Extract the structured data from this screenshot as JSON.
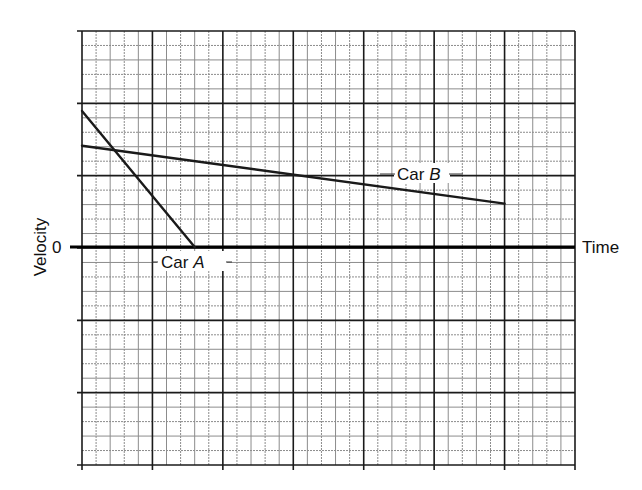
{
  "chart_data": {
    "type": "line",
    "title": "",
    "xlabel": "Time",
    "ylabel": "Velocity",
    "y_tick_labels": [
      {
        "value": 0,
        "label": "0"
      }
    ],
    "grid": {
      "on": true,
      "x_minor_units": 35,
      "y_minor_units": 30,
      "minor_per_major": 5,
      "x_range": [
        0,
        35
      ],
      "y_range": [
        -15,
        15
      ]
    },
    "xlim": [
      0,
      35
    ],
    "ylim": [
      -15,
      15
    ],
    "units": "grid squares (no numeric scale shown)",
    "legend": "none (inline labels)",
    "series": [
      {
        "name": "Car A",
        "label_text": "Car",
        "label_italic": "A",
        "points": [
          [
            0,
            9.4
          ],
          [
            8,
            0
          ]
        ],
        "color": "#1a1a1a"
      },
      {
        "name": "Car B",
        "label_text": "Car",
        "label_italic": "B",
        "points": [
          [
            0,
            7
          ],
          [
            30,
            3
          ]
        ],
        "color": "#1a1a1a"
      }
    ],
    "annotations": [
      {
        "text": "Car A",
        "near": [
          8,
          -1
        ]
      },
      {
        "text": "Car B",
        "near": [
          24,
          5.1
        ]
      }
    ]
  },
  "labels": {
    "x_axis": "Time",
    "y_axis": "Velocity",
    "zero": "0",
    "car_a_prefix": "Car ",
    "car_a_letter": "A",
    "car_b_prefix": "Car ",
    "car_b_letter": "B"
  },
  "colors": {
    "major_grid": "#1a1a1a",
    "minor_grid": "#8c8c8c",
    "background": "#ffffff"
  }
}
